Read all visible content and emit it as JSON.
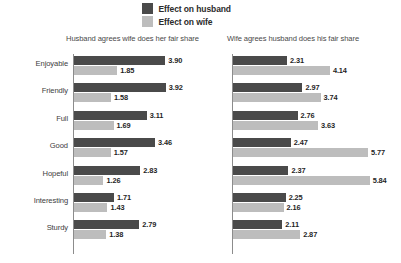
{
  "legend": {
    "items": [
      {
        "label": "Effect on husband",
        "color": "#4a4a4a",
        "icon": "legend-swatch-husband"
      },
      {
        "label": "Effect on wife",
        "color": "#bdbdbd",
        "icon": "legend-swatch-wife"
      }
    ]
  },
  "chart_data": {
    "type": "bar",
    "orientation": "horizontal",
    "grouped": true,
    "title": "",
    "xlabel": "",
    "ylabel": "",
    "grid": false,
    "legend_position": "top-center",
    "legend": [
      "Effect on husband",
      "Effect on wife"
    ],
    "colors": {
      "husband": "#4a4a4a",
      "wife": "#bdbdbd"
    },
    "xlim": [
      0,
      6.2
    ],
    "categories": [
      "Enjoyable",
      "Friendly",
      "Full",
      "Good",
      "Hopeful",
      "Interesting",
      "Sturdy"
    ],
    "panels": [
      {
        "title": "Husband agrees wife does her fair share",
        "series": [
          {
            "name": "Effect on husband",
            "values": [
              3.9,
              3.92,
              3.11,
              3.46,
              2.83,
              1.71,
              2.79
            ]
          },
          {
            "name": "Effect on wife",
            "values": [
              1.85,
              1.58,
              1.69,
              1.57,
              1.26,
              1.43,
              1.38
            ]
          }
        ]
      },
      {
        "title": "Wife agrees husband does his fair share",
        "series": [
          {
            "name": "Effect on husband",
            "values": [
              2.31,
              2.97,
              2.76,
              2.47,
              2.37,
              2.25,
              2.11
            ]
          },
          {
            "name": "Effect on wife",
            "values": [
              4.14,
              3.74,
              3.63,
              5.77,
              5.84,
              2.16,
              2.87
            ]
          }
        ]
      }
    ]
  }
}
